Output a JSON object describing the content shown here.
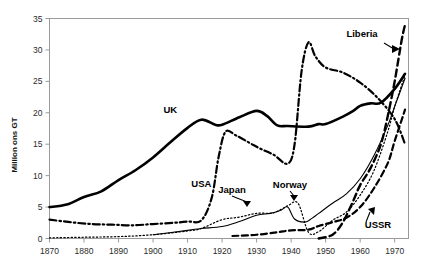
{
  "chart_data": {
    "type": "line",
    "title": "",
    "subtitle": "",
    "xlabel": "",
    "ylabel": "Million ons GT",
    "xlim": [
      1870,
      1974
    ],
    "ylim": [
      0,
      35
    ],
    "grid": false,
    "legend_position": "inline-annotations",
    "xticks": [
      "1870",
      "1880",
      "1890",
      "1900",
      "1910",
      "1920",
      "1930",
      "1940",
      "1950",
      "1960",
      "1970"
    ],
    "yticks": [
      "0",
      "5",
      "10",
      "15",
      "20",
      "25",
      "30",
      "35"
    ],
    "annotations": [
      {
        "label": "UK",
        "x": 1905,
        "y": 20.0,
        "arrow": false
      },
      {
        "label": "USA",
        "x": 1914,
        "y": 8.2,
        "arrow": false
      },
      {
        "label": "Japan",
        "x": 1931,
        "y": 5.0,
        "arrow": true
      },
      {
        "label": "Norway",
        "x": 1943,
        "y": 6.0,
        "arrow": true
      },
      {
        "label": "Liberia",
        "x": 1962,
        "y": 31.5,
        "arrow": true
      },
      {
        "label": "USSR",
        "x": 1966,
        "y": 2.0,
        "arrow": true
      }
    ],
    "series": [
      {
        "name": "UK",
        "style": "solid-thick",
        "x": [
          1870,
          1875,
          1880,
          1885,
          1890,
          1895,
          1900,
          1905,
          1910,
          1914,
          1918,
          1920,
          1925,
          1930,
          1933,
          1936,
          1939,
          1945,
          1948,
          1950,
          1955,
          1958,
          1960,
          1963,
          1966,
          1970,
          1973
        ],
        "values": [
          5.0,
          5.4,
          6.6,
          7.5,
          9.3,
          10.9,
          12.9,
          15.3,
          17.6,
          18.9,
          18.1,
          18.1,
          19.3,
          20.3,
          19.5,
          18.0,
          17.9,
          17.8,
          18.2,
          18.2,
          19.4,
          20.3,
          21.1,
          21.5,
          21.6,
          23.8,
          26.2
        ]
      },
      {
        "name": "USA",
        "style": "dash-dot",
        "x": [
          1870,
          1876,
          1882,
          1888,
          1894,
          1900,
          1906,
          1910,
          1914,
          1917,
          1919,
          1921,
          1924,
          1928,
          1931,
          1935,
          1939,
          1941,
          1943,
          1945,
          1947,
          1950,
          1955,
          1960,
          1965,
          1970,
          1973
        ],
        "values": [
          3.0,
          2.6,
          2.3,
          2.2,
          2.1,
          2.3,
          2.5,
          2.7,
          2.9,
          6.5,
          13.0,
          17.0,
          16.4,
          15.2,
          14.3,
          13.3,
          11.9,
          15.0,
          26.5,
          31.2,
          29.0,
          27.2,
          26.4,
          24.8,
          22.4,
          19.0,
          15.0
        ]
      },
      {
        "name": "Liberia",
        "style": "dashed",
        "x": [
          1948,
          1952,
          1955,
          1958,
          1960,
          1963,
          1966,
          1968,
          1970,
          1972,
          1973
        ],
        "values": [
          0.0,
          0.6,
          2.6,
          6.0,
          8.5,
          11.2,
          15.0,
          19.5,
          25.0,
          31.5,
          34.0
        ]
      },
      {
        "name": "Norway",
        "style": "solid-thin",
        "x": [
          1900,
          1910,
          1914,
          1920,
          1925,
          1930,
          1934,
          1937,
          1939,
          1941,
          1944,
          1946,
          1948,
          1952,
          1956,
          1960,
          1964,
          1968,
          1970,
          1973
        ],
        "values": [
          0.6,
          1.3,
          1.6,
          1.9,
          2.7,
          3.7,
          4.0,
          4.5,
          5.0,
          3.1,
          2.6,
          3.2,
          4.0,
          5.6,
          7.1,
          9.5,
          13.2,
          18.0,
          21.0,
          25.5
        ]
      },
      {
        "name": "Japan",
        "style": "dotted",
        "x": [
          1870,
          1880,
          1890,
          1900,
          1910,
          1914,
          1920,
          1925,
          1930,
          1935,
          1939,
          1942,
          1945,
          1948,
          1952,
          1956,
          1960,
          1964,
          1968,
          1970,
          1973
        ],
        "values": [
          0.1,
          0.2,
          0.3,
          0.6,
          1.2,
          1.6,
          3.0,
          3.4,
          4.0,
          4.1,
          5.2,
          5.6,
          1.0,
          1.1,
          2.9,
          4.2,
          6.9,
          10.8,
          17.0,
          21.0,
          26.0
        ]
      },
      {
        "name": "USSR",
        "style": "dashed-thick",
        "x": [
          1923,
          1930,
          1936,
          1940,
          1945,
          1948,
          1952,
          1956,
          1960,
          1964,
          1968,
          1970,
          1973
        ],
        "values": [
          0.4,
          0.6,
          1.0,
          1.3,
          1.4,
          2.0,
          2.6,
          3.3,
          5.0,
          8.0,
          12.0,
          15.5,
          20.5
        ]
      }
    ]
  },
  "axes": {
    "y_axis_title": "Million ons GT"
  }
}
